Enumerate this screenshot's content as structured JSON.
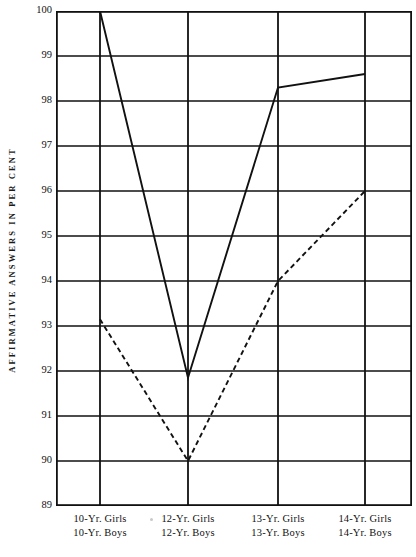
{
  "chart_data": {
    "type": "line",
    "title": "",
    "xlabel": "",
    "ylabel": "AFFIRMATIVE ANSWERS IN PER CENT",
    "categories": [
      "10-Yr.",
      "12-Yr.",
      "13-Yr.",
      "14-Yr."
    ],
    "category_labels": [
      {
        "girls": "10-Yr.  Girls",
        "boys": "10-Yr.  Boys"
      },
      {
        "girls": "12-Yr.  Girls",
        "boys": "12-Yr.  Boys"
      },
      {
        "girls": "13-Yr.  Girls",
        "boys": "13-Yr.  Boys"
      },
      {
        "girls": "14-Yr.  Girls",
        "boys": "14-Yr.  Boys"
      }
    ],
    "series": [
      {
        "name": "Girls",
        "style": "solid",
        "values": [
          100.0,
          91.85,
          98.3,
          98.6
        ]
      },
      {
        "name": "Boys",
        "style": "dashed",
        "values": [
          93.15,
          90.0,
          94.0,
          96.0
        ]
      }
    ],
    "ylim": [
      89,
      100
    ],
    "yticks": [
      100,
      99,
      98,
      97,
      96,
      95,
      94,
      93,
      92,
      91,
      90,
      89
    ],
    "ytick_labels": [
      "100",
      "99",
      "98",
      "97",
      "96",
      "95",
      "94",
      "93",
      "92",
      "91",
      "90",
      "89"
    ],
    "grid": true,
    "legend": "none",
    "line_color": "#111111"
  }
}
